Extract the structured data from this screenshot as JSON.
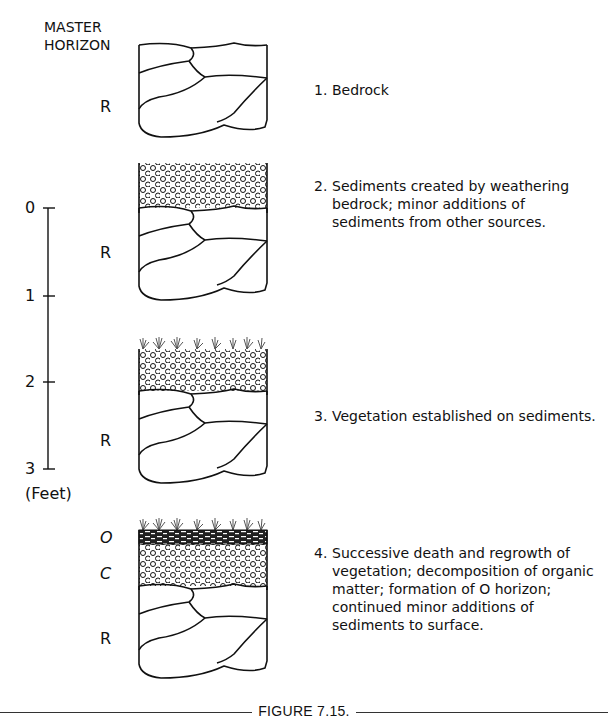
{
  "header": {
    "line1": "MASTER",
    "line2": "HORIZON"
  },
  "scale": {
    "ticks": [
      "0",
      "1",
      "2",
      "3"
    ],
    "unit": "(Feet)"
  },
  "stages": [
    {
      "horizons": [
        "R"
      ],
      "description": {
        "number": "1.",
        "lines": [
          "Bedrock"
        ]
      }
    },
    {
      "horizons": [
        "R"
      ],
      "description": {
        "number": "2.",
        "lines": [
          "Sediments created by weathering",
          "bedrock; minor additions of",
          "sediments from other sources."
        ]
      }
    },
    {
      "horizons": [
        "R"
      ],
      "description": {
        "number": "3.",
        "lines": [
          "Vegetation established on sediments."
        ]
      }
    },
    {
      "horizons": [
        "O",
        "C",
        "R"
      ],
      "description": {
        "number": "4.",
        "lines": [
          "Successive death and regrowth of",
          "vegetation; decomposition of organic",
          "matter; formation of O horizon;",
          "continued minor additions of",
          "sediments to surface."
        ]
      }
    }
  ],
  "caption": "FIGURE 7.15."
}
